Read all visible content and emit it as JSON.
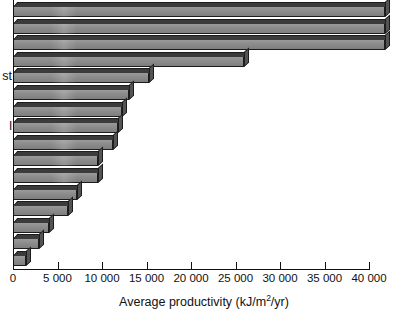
{
  "chart_data": {
    "type": "bar",
    "orientation": "horizontal",
    "title": "",
    "xlabel": "Average productivity (kJ/m2/yr)",
    "xlabel_parts": {
      "prefix": "Average productivity (kJ/m",
      "sup": "2",
      "suffix": "/yr)"
    },
    "ylabel": "",
    "xlim": [
      0,
      40000
    ],
    "xticks": [
      0,
      5000,
      10000,
      15000,
      20000,
      25000,
      30000,
      35000,
      40000
    ],
    "xtick_labels": [
      "0",
      "5 000",
      "10 000",
      "15 000",
      "20 000",
      "25 000",
      "30 000",
      "35 000",
      "40 000"
    ],
    "grid": false,
    "legend": false,
    "categories": [
      "",
      "",
      "",
      "",
      "",
      "",
      "",
      "",
      "",
      "",
      "",
      "",
      "",
      "",
      "",
      ""
    ],
    "values": [
      41800,
      41800,
      41800,
      26000,
      15300,
      13000,
      12300,
      11800,
      11200,
      9600,
      9600,
      7200,
      6200,
      4100,
      2900,
      1500
    ],
    "bar_face_color": "#8d8d8d",
    "bar_edge_color": "#1c1c1c",
    "bar_top_color": "#3b3b3b",
    "bar_side_color": "#545454",
    "visible_y_labels": [
      {
        "text": "st",
        "row": 4
      },
      {
        "text": "l",
        "row": 7
      }
    ]
  },
  "axis": {
    "x_title_prefix": "Average productivity (kJ/m",
    "x_title_sup": "2",
    "x_title_suffix": "/yr)"
  }
}
